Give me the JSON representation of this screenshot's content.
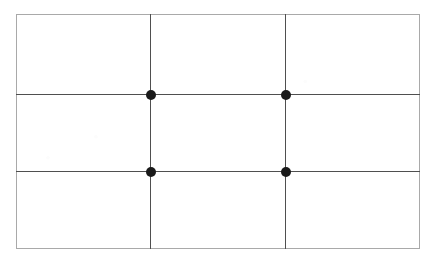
{
  "figure": {
    "type": "diagram",
    "canvas": {
      "width": 436,
      "height": 263,
      "background_color": "#ffffff"
    },
    "frame": {
      "label": "Composition frame",
      "x": 16,
      "y": 14,
      "width": 404,
      "height": 235,
      "border_color": "#a9a9a9",
      "border_width": 1,
      "fill_color": "#ffffff"
    },
    "grid": {
      "label": "Thirds grid",
      "columns": 3,
      "rows": 3,
      "line_color": "#4f4f4f",
      "line_width": 1,
      "vertical_lines": [
        {
          "name": "left-third",
          "x": 150
        },
        {
          "name": "right-third",
          "x": 285
        }
      ],
      "horizontal_lines": [
        {
          "name": "upper-third",
          "y": 94
        },
        {
          "name": "lower-third",
          "y": 171
        }
      ]
    },
    "points": {
      "label": "Power points",
      "count": 4,
      "color": "#1a1a1a",
      "diameter": 10,
      "items": [
        {
          "name": "top-left",
          "x": 150.5,
          "y": 94.5
        },
        {
          "name": "top-right",
          "x": 285.5,
          "y": 94.5
        },
        {
          "name": "bottom-left",
          "x": 150.5,
          "y": 171.5
        },
        {
          "name": "bottom-right",
          "x": 285.5,
          "y": 171.5
        }
      ]
    },
    "cells": [
      {
        "name": "cell-top-left"
      },
      {
        "name": "cell-top-center"
      },
      {
        "name": "cell-top-right"
      },
      {
        "name": "cell-middle-left"
      },
      {
        "name": "cell-middle-center"
      },
      {
        "name": "cell-middle-right"
      },
      {
        "name": "cell-bottom-left"
      },
      {
        "name": "cell-bottom-center"
      },
      {
        "name": "cell-bottom-right"
      }
    ]
  }
}
